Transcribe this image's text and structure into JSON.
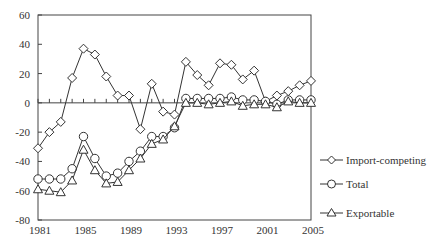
{
  "chart_data": {
    "type": "line",
    "title": "",
    "xlabel": "",
    "ylabel": "",
    "x": [
      1981,
      1982,
      1983,
      1984,
      1985,
      1986,
      1987,
      1988,
      1989,
      1990,
      1991,
      1992,
      1993,
      1994,
      1995,
      1996,
      1997,
      1998,
      1999,
      2000,
      2001,
      2002,
      2003,
      2004,
      2005
    ],
    "xticks": [
      1981,
      1985,
      1989,
      1993,
      1997,
      2001,
      2005
    ],
    "ylim": [
      -80,
      60
    ],
    "yticks": [
      -80,
      -60,
      -40,
      -20,
      0,
      20,
      40,
      60
    ],
    "grid": false,
    "zero_line": true,
    "legend_position": "right",
    "series": [
      {
        "name": "Import-competing",
        "marker": "diamond",
        "values": [
          -31,
          -20,
          -13,
          17,
          37,
          33,
          18,
          5,
          5,
          -18,
          13,
          -6,
          -8,
          28,
          19,
          12,
          27,
          26,
          16,
          22,
          1,
          5,
          8,
          12,
          15
        ]
      },
      {
        "name": "Total",
        "marker": "circle",
        "values": [
          -52,
          -52,
          -52,
          -45,
          -23,
          -38,
          -50,
          -48,
          -40,
          -33,
          -23,
          -23,
          -17,
          3,
          3,
          3,
          3,
          4,
          2,
          2,
          1,
          -1,
          2,
          2,
          2
        ]
      },
      {
        "name": "Exportable",
        "marker": "triangle",
        "values": [
          -59,
          -60,
          -61,
          -53,
          -32,
          -46,
          -55,
          -54,
          -46,
          -38,
          -28,
          -25,
          -16,
          0,
          0,
          -1,
          0,
          1,
          -2,
          -1,
          -1,
          -3,
          1,
          0,
          0
        ]
      }
    ]
  },
  "legend": {
    "items": [
      {
        "label": "Import-competing"
      },
      {
        "label": "Total"
      },
      {
        "label": "Exportable"
      }
    ]
  },
  "colors": {
    "line": "#333333",
    "marker_fill": "#ffffff",
    "axis": "#444444"
  }
}
